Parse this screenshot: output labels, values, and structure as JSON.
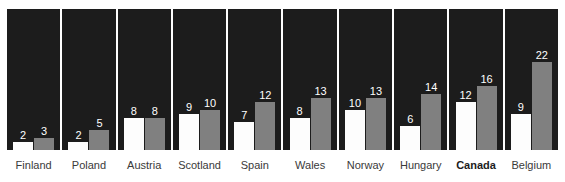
{
  "chart_data": {
    "type": "bar",
    "title": "",
    "xlabel": "",
    "ylabel": "",
    "grid": false,
    "legend_position": "none",
    "ylim": [
      0,
      24
    ],
    "categories": [
      "Finland",
      "Poland",
      "Austria",
      "Scotland",
      "Spain",
      "Wales",
      "Norway",
      "Hungary",
      "Canada",
      "Belgium"
    ],
    "highlight_category": "Canada",
    "series": [
      {
        "name": "series-a",
        "color": "#fdfdfd",
        "values": [
          2,
          2,
          8,
          9,
          7,
          8,
          10,
          6,
          12,
          9
        ]
      },
      {
        "name": "series-b",
        "color": "#808080",
        "values": [
          3,
          5,
          8,
          10,
          12,
          13,
          13,
          14,
          16,
          22
        ]
      }
    ]
  },
  "style": {
    "panel_background": "#1c1c1c",
    "page_background": "#ffffff",
    "label_color": "#3a3a3a",
    "value_color": "#ffffff",
    "px_per_unit": 4
  }
}
